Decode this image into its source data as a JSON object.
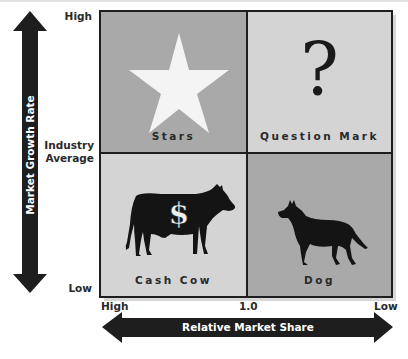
{
  "diagram": {
    "y_axis": {
      "title": "Market Growth Rate",
      "labels": {
        "high": "High",
        "mid_line1": "Industry",
        "mid_line2": "Average",
        "low": "Low"
      }
    },
    "x_axis": {
      "title": "Relative Market Share",
      "labels": {
        "high": "High",
        "mid": "1.0",
        "low": "Low"
      }
    },
    "quadrants": [
      {
        "label": "Stars",
        "icon": "star-icon",
        "position": "top-left",
        "color": "#a9a9a9"
      },
      {
        "label": "Question Mark",
        "icon": "question-mark-icon",
        "glyph": "?",
        "position": "top-right",
        "color": "#d4d4d4"
      },
      {
        "label": "Cash Cow",
        "icon": "cow-icon",
        "glyph": "$",
        "position": "bottom-left",
        "color": "#d4d4d4"
      },
      {
        "label": "Dog",
        "icon": "dog-icon",
        "position": "bottom-right",
        "color": "#a9a9a9"
      }
    ],
    "colors": {
      "arrow": "#1e1e1e",
      "border": "#1e1e1e",
      "star": "#f4f4f4",
      "silhouette": "#141414"
    }
  }
}
